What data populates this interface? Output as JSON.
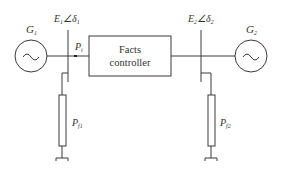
{
  "diagram": {
    "generator_left": {
      "label": "G",
      "subscript": "1",
      "symbol": "~"
    },
    "generator_right": {
      "label": "G",
      "subscript": "2",
      "symbol": "~"
    },
    "bus_left": {
      "voltage": "E",
      "voltage_sub": "1",
      "angle_symbol": "∠δ",
      "angle_sub": "1"
    },
    "bus_right": {
      "voltage": "E",
      "voltage_sub": "2",
      "angle_symbol": "∠δ",
      "angle_sub": "2"
    },
    "power_flow": {
      "label": "P",
      "subscript": "t"
    },
    "controller": {
      "line1": "Facts",
      "line2": "controller"
    },
    "load_left": {
      "label": "P",
      "subscript": "f1"
    },
    "load_right": {
      "label": "P",
      "subscript": "f2"
    }
  }
}
